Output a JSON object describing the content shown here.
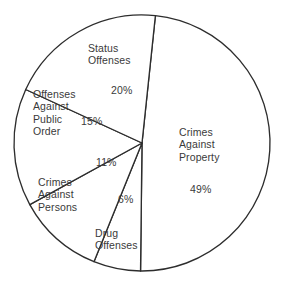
{
  "chart_data": {
    "type": "pie",
    "title": "",
    "subtitle": "",
    "xlabel": "",
    "ylabel": "",
    "legend_position": "none",
    "grid": false,
    "units": "percent",
    "start_angle_deg": 6,
    "direction": "clockwise",
    "categories": [
      "Crimes Against Property",
      "Drug Offenses",
      "Crimes Against Persons",
      "Offenses Against Public Order",
      "Status Offenses"
    ],
    "values": [
      49,
      6,
      11,
      15,
      20
    ],
    "slices": [
      {
        "id": "crimes-against-property",
        "name": "Crimes\nAgainst\nProperty",
        "name_flat": "Crimes Against Property",
        "value": 49,
        "percent_label": "49%",
        "fill": "#ffffff",
        "stroke": "#2d2d2d"
      },
      {
        "id": "drug-offenses",
        "name": "Drug\nOffenses",
        "name_flat": "Drug Offenses",
        "value": 6,
        "percent_label": "6%",
        "fill": "#ffffff",
        "stroke": "#2d2d2d"
      },
      {
        "id": "crimes-against-persons",
        "name": "Crimes\nAgainst\nPersons",
        "name_flat": "Crimes Against Persons",
        "value": 11,
        "percent_label": "11%",
        "fill": "#ffffff",
        "stroke": "#2d2d2d"
      },
      {
        "id": "offenses-against-public-order",
        "name": "Offenses\nAgainst\nPublic\nOrder",
        "name_flat": "Offenses Against Public Order",
        "value": 15,
        "percent_label": "15%",
        "fill": "#ffffff",
        "stroke": "#2d2d2d"
      },
      {
        "id": "status-offenses",
        "name": "Status\nOffenses",
        "name_flat": "Status Offenses",
        "value": 20,
        "percent_label": "20%",
        "fill": "#ffffff",
        "stroke": "#2d2d2d"
      }
    ],
    "geometry": {
      "center_x": 142,
      "center_y": 143,
      "radius": 128
    },
    "label_positions": {
      "crimes-against-property": {
        "name_x": 179,
        "name_y": 126,
        "pct_x": 190,
        "pct_y": 183
      },
      "drug-offenses": {
        "name_x": 95,
        "name_y": 227,
        "pct_x": 118,
        "pct_y": 193
      },
      "crimes-against-persons": {
        "name_x": 38,
        "name_y": 176,
        "pct_x": 96,
        "pct_y": 156
      },
      "offenses-against-public-order": {
        "name_x": 33,
        "name_y": 88,
        "pct_x": 81,
        "pct_y": 115
      },
      "status-offenses": {
        "name_x": 88,
        "name_y": 42,
        "pct_x": 111,
        "pct_y": 84
      }
    }
  }
}
